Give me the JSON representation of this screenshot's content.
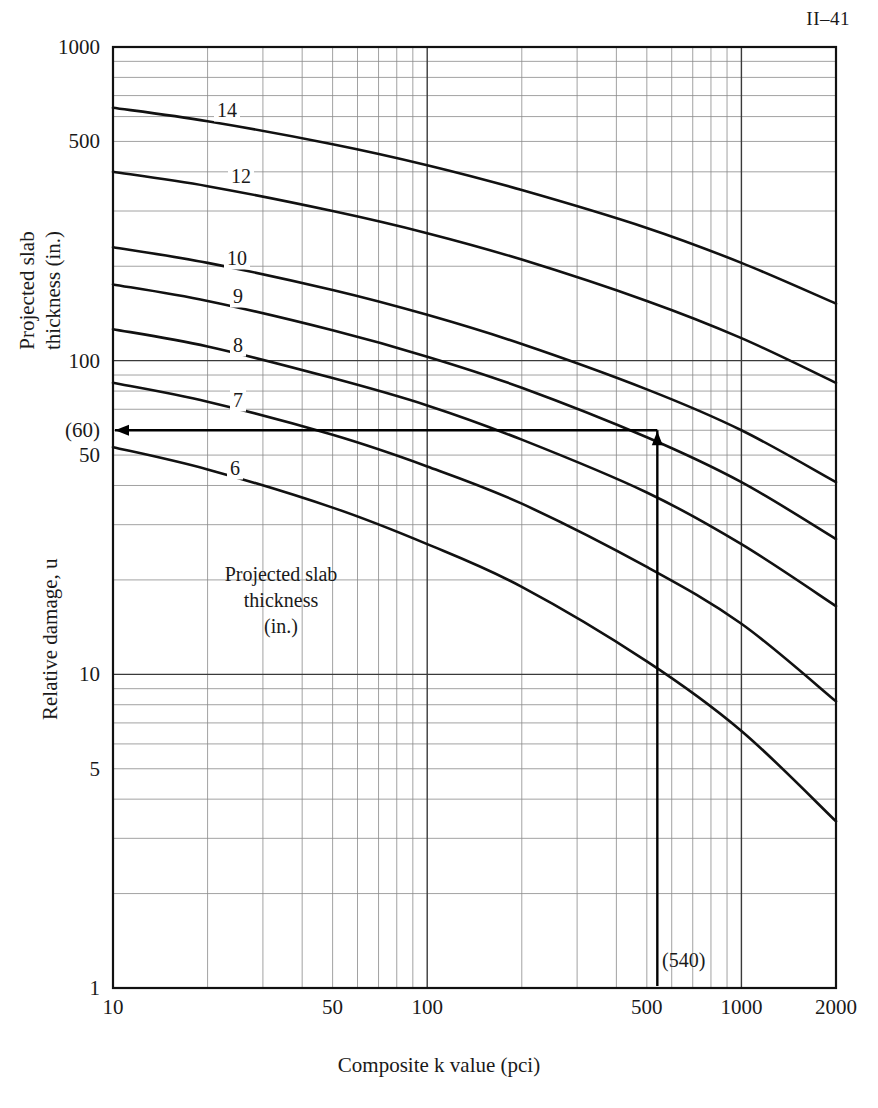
{
  "page": {
    "header": "II–41"
  },
  "axes": {
    "x": {
      "title": "Composite k value (pci)",
      "scale": "log",
      "min": 10,
      "max": 2000,
      "tick_labels": [
        "10",
        "50",
        "100",
        "500",
        "1000",
        "2000"
      ],
      "tick_values": [
        10,
        50,
        100,
        500,
        1000,
        2000
      ]
    },
    "y": {
      "title_top": [
        "Projected slab",
        "thickness (in.)"
      ],
      "title_bottom": "Relative damage, u",
      "scale": "log",
      "min": 1,
      "max": 1000,
      "tick_labels": [
        "1000",
        "500",
        "100",
        "(60)",
        "50",
        "10",
        "5",
        "1"
      ],
      "tick_values": [
        1000,
        500,
        100,
        60,
        50,
        10,
        5,
        1
      ]
    }
  },
  "plot_note": [
    "Projected slab",
    "thickness",
    "(in.)"
  ],
  "annotations": {
    "x_readout": "(540)",
    "y_readout": "(60)",
    "x_readout_value": 540,
    "y_readout_value": 60
  },
  "chart_data": {
    "type": "line",
    "title": "",
    "xlabel": "Composite k value (pci)",
    "ylabel": "Relative damage, u",
    "xscale": "log",
    "yscale": "log",
    "xlim": [
      10,
      2000
    ],
    "ylim": [
      1,
      1000
    ],
    "grid": true,
    "legend": "inline curve labels (slab thickness, in.)",
    "series": [
      {
        "name": "14",
        "label": "14",
        "x": [
          10,
          20,
          50,
          100,
          200,
          500,
          1000,
          2000
        ],
        "y": [
          640,
          580,
          490,
          420,
          350,
          265,
          205,
          152
        ]
      },
      {
        "name": "12",
        "label": "12",
        "x": [
          10,
          20,
          50,
          100,
          200,
          500,
          1000,
          2000
        ],
        "y": [
          400,
          360,
          300,
          255,
          210,
          155,
          118,
          85
        ]
      },
      {
        "name": "10",
        "label": "10",
        "x": [
          10,
          20,
          50,
          100,
          200,
          500,
          1000,
          2000
        ],
        "y": [
          230,
          205,
          168,
          140,
          113,
          81,
          60,
          41
        ]
      },
      {
        "name": "9",
        "label": "9",
        "x": [
          10,
          20,
          50,
          100,
          200,
          500,
          1000,
          2000
        ],
        "y": [
          175,
          155,
          125,
          103,
          82,
          57,
          41,
          27
        ]
      },
      {
        "name": "8",
        "label": "8",
        "x": [
          10,
          20,
          50,
          100,
          200,
          500,
          1000,
          2000
        ],
        "y": [
          126,
          111,
          88,
          72,
          56,
          38,
          26,
          16.5
        ]
      },
      {
        "name": "7",
        "label": "7",
        "x": [
          10,
          20,
          50,
          100,
          200,
          500,
          1000,
          2000
        ],
        "y": [
          85,
          74,
          58,
          46,
          35,
          22,
          14.5,
          8.2
        ]
      },
      {
        "name": "6",
        "label": "6",
        "x": [
          10,
          20,
          50,
          100,
          200,
          500,
          1000,
          2000
        ],
        "y": [
          53,
          45,
          34,
          26,
          19,
          11,
          6.6,
          3.4
        ]
      }
    ],
    "curve_labels": [
      "14",
      "12",
      "10",
      "9",
      "8",
      "7",
      "6"
    ],
    "construction_lines": [
      {
        "type": "vertical-arrow",
        "x": 540,
        "from_y": 1,
        "to_y": 60
      },
      {
        "type": "horizontal-arrow",
        "y": 60,
        "from_x": 540,
        "to_x": 10
      }
    ]
  }
}
